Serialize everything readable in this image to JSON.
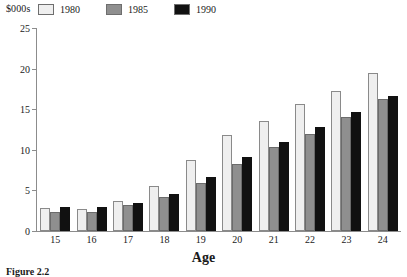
{
  "figure": {
    "caption": "Figure 2.2",
    "y_unit_label": "$000s",
    "x_axis_title": "Age"
  },
  "legend": {
    "position": "top-left-inside",
    "entries": [
      {
        "label": "1980",
        "color": "#efefef"
      },
      {
        "label": "1985",
        "color": "#8f8f8f"
      },
      {
        "label": "1990",
        "color": "#111111"
      }
    ]
  },
  "axes": {
    "y_ticks": [
      "0",
      "5",
      "10",
      "15",
      "20",
      "25"
    ],
    "x_ticks": [
      "15",
      "16",
      "17",
      "18",
      "19",
      "20",
      "21",
      "22",
      "23",
      "24"
    ]
  },
  "chart_data": {
    "type": "bar",
    "title": "Figure 2.2",
    "xlabel": "Age",
    "ylabel": "$000s",
    "ylim": [
      0,
      25
    ],
    "ytick_step": 5,
    "grid": false,
    "legend_position": "upper left",
    "categories": [
      "15",
      "16",
      "17",
      "18",
      "19",
      "20",
      "21",
      "22",
      "23",
      "24"
    ],
    "series": [
      {
        "name": "1980",
        "color": "#efefef",
        "values": [
          2.8,
          2.7,
          3.7,
          5.6,
          8.7,
          11.8,
          13.6,
          15.6,
          17.3,
          19.5
        ]
      },
      {
        "name": "1985",
        "color": "#8f8f8f",
        "values": [
          2.4,
          2.3,
          3.2,
          4.2,
          5.9,
          8.3,
          10.4,
          12.0,
          14.1,
          16.3
        ]
      },
      {
        "name": "1990",
        "color": "#111111",
        "values": [
          3.0,
          2.9,
          3.5,
          4.5,
          6.6,
          9.1,
          11.0,
          12.8,
          14.7,
          16.6
        ]
      }
    ]
  }
}
